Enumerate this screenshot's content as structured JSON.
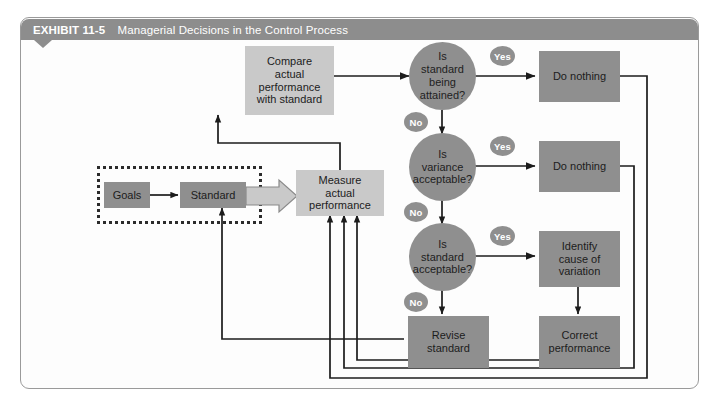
{
  "exhibit": {
    "label": "EXHIBIT",
    "number": "11-5",
    "title": "Managerial Decisions in the Control Process"
  },
  "nodes": {
    "goals": "Goals",
    "standard": "Standard",
    "measure": "Measure\nactual\nperformance",
    "compare": "Compare\nactual\nperformance\nwith standard",
    "decision1": "Is\nstandard\nbeing\nattained?",
    "decision2": "Is\nvariance\nacceptable?",
    "decision3": "Is\nstandard\nacceptable?",
    "do_nothing_1": "Do nothing",
    "do_nothing_2": "Do nothing",
    "identify": "Identify\ncause of\nvariation",
    "revise": "Revise\nstandard",
    "correct": "Correct\nperformance"
  },
  "edge_labels": {
    "yes1": "Yes",
    "yes2": "Yes",
    "yes3": "Yes",
    "no1": "No",
    "no2": "No",
    "no3": "No"
  },
  "colors": {
    "banner": "#8d8d8d",
    "light_box": "#c9c9c9",
    "dark_box": "#8f8f8f",
    "circle": "#8f8f8f",
    "line": "#1c1c1c",
    "frame": "#9a9a9a"
  }
}
